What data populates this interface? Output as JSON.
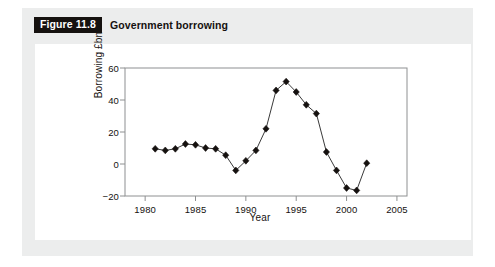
{
  "figure": {
    "tag": "Figure 11.8",
    "caption": "Government borrowing"
  },
  "colors": {
    "outer_panel": "#eceded",
    "chart_panel": "#ffffff",
    "axis": "#8e9091",
    "marker": "#15110f",
    "line": "#3a3a3a",
    "text": "#15110f",
    "tag_bg": "#15110f",
    "tag_fg": "#ffffff"
  },
  "chart_data": {
    "type": "line",
    "title": "Government borrowing",
    "xlabel": "Year",
    "ylabel": "Borrowing £bn",
    "xlim": [
      1978,
      2006
    ],
    "ylim": [
      -20,
      60
    ],
    "xticks": [
      1980,
      1985,
      1990,
      1995,
      2000,
      2005
    ],
    "xtick_labels": [
      "1980",
      "1985",
      "1990",
      "1995",
      "2000",
      "2005"
    ],
    "yticks": [
      -20,
      0,
      20,
      40,
      60
    ],
    "ytick_labels": [
      "−20",
      "0",
      "20",
      "40",
      "60"
    ],
    "grid": false,
    "legend": false,
    "marker": "diamond",
    "x": [
      1981,
      1982,
      1983,
      1984,
      1985,
      1986,
      1987,
      1988,
      1989,
      1990,
      1991,
      1992,
      1993,
      1994,
      1995,
      1996,
      1997,
      1998,
      1999,
      2000,
      2001,
      2002
    ],
    "values": [
      9.5,
      8.5,
      9.5,
      12.5,
      12,
      10,
      9.5,
      5.5,
      -4,
      2,
      8.5,
      22,
      46,
      51.5,
      45,
      37,
      31.5,
      7.5,
      -4,
      -15,
      -16.5,
      0.5
    ],
    "series": [
      {
        "name": "Borrowing £bn",
        "values": [
          9.5,
          8.5,
          9.5,
          12.5,
          12,
          10,
          9.5,
          5.5,
          -4,
          2,
          8.5,
          22,
          46,
          51.5,
          45,
          37,
          31.5,
          7.5,
          -4,
          -15,
          -16.5,
          0.5
        ]
      }
    ]
  }
}
